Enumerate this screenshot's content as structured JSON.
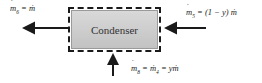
{
  "component": {
    "title": "Condenser"
  },
  "streams": {
    "outlet_6": {
      "symbol": "m",
      "subscript": "6",
      "rhs": "= ṁ",
      "direction": "out-left"
    },
    "inlet_5": {
      "symbol": "m",
      "subscript": "5",
      "rhs": "= (1 − y) ṁ",
      "direction": "in-right"
    },
    "inlet_8": {
      "symbol": "m",
      "subscript": "8",
      "mid": "= ṁ",
      "mid_subscript": "4",
      "rhs": "= yṁ",
      "direction": "in-bottom"
    }
  },
  "colors": {
    "arrow": "#1a1a1a",
    "box_fill": "#cccccc",
    "boundary": "#1a1a1a"
  }
}
